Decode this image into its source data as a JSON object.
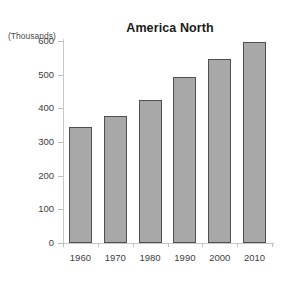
{
  "chart_data": {
    "type": "bar",
    "title": "America North",
    "xlabel": "",
    "ylabel": "(Thousands)",
    "categories": [
      "1960",
      "1970",
      "1980",
      "1990",
      "2000",
      "2010"
    ],
    "values": [
      345,
      378,
      425,
      492,
      548,
      597
    ],
    "ylim": [
      0,
      600
    ],
    "ytick_labels": [
      "0",
      "100",
      "200",
      "300",
      "400",
      "500",
      "600"
    ],
    "ytick_values": [
      0,
      100,
      200,
      300,
      400,
      500,
      600
    ],
    "grid": false,
    "legend": false,
    "bar_color": "#a8a8a8",
    "bar_edge_color": "#4f4f4f",
    "axis_color": "#c8c8c8",
    "background_color": "#ffffff"
  }
}
